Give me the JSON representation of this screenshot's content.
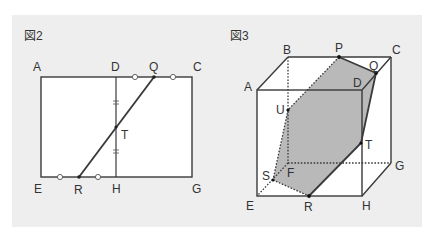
{
  "colors": {
    "panel_bg": "#eeeeee",
    "face_fill": "#ffffff",
    "line": "#3a3a3a",
    "section_fill": "#b9b9b9",
    "label": "#333333"
  },
  "figure2": {
    "title": "図2",
    "labels": {
      "A": "A",
      "D": "D",
      "Q": "Q",
      "C": "C",
      "T": "T",
      "E": "E",
      "R": "R",
      "H": "H",
      "G": "G"
    },
    "marks": {
      "equal_circle": "○",
      "equal_tick": "="
    }
  },
  "figure3": {
    "title": "図3",
    "labels": {
      "B": "B",
      "P": "P",
      "C": "C",
      "A": "A",
      "Q": "Q",
      "D": "D",
      "U": "U",
      "T": "T",
      "S": "S",
      "F": "F",
      "G": "G",
      "E": "E",
      "R": "R",
      "H": "H"
    },
    "section_name": "cross-section-PQTRSU"
  }
}
